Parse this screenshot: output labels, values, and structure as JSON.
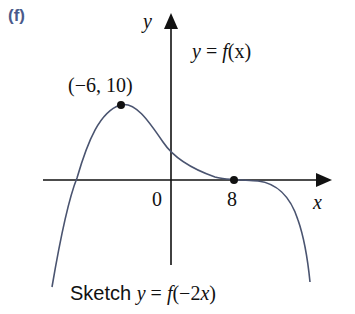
{
  "part_label": "(f)",
  "axes": {
    "x_label": "x",
    "y_label": "y",
    "origin_label": "0"
  },
  "curve": {
    "equation_lhs": "y",
    "equation_eq": " = ",
    "equation_f": "f",
    "equation_arg": "(x)",
    "stroke_color": "#4a5470"
  },
  "annotations": {
    "max_point_label": "(−6, 10)",
    "x_intercept_label": "8"
  },
  "task": {
    "prefix": "Sketch ",
    "y": "y",
    "eq": " = ",
    "f": "f",
    "arg_open": "(−2",
    "x": "x",
    "arg_close": ")"
  },
  "key_points": [
    {
      "name": "maximum",
      "x": -6,
      "y": 10
    },
    {
      "name": "x-intercept-point-of-inflection",
      "x": 8,
      "y": 0
    }
  ]
}
